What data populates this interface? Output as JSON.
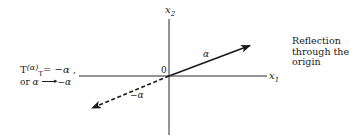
{
  "diagram": {
    "type": "vector-reflection",
    "axes": {
      "horizontal_label": "x",
      "horizontal_subscript": "1",
      "vertical_label": "x",
      "vertical_subscript": "2",
      "origin_label": "0"
    },
    "vectors": [
      {
        "name": "alpha",
        "label": "α",
        "style": "solid",
        "direction": "up-right"
      },
      {
        "name": "neg-alpha",
        "label": "−α",
        "style": "dashed",
        "direction": "down-left"
      }
    ],
    "caption_lines": [
      "Reflection",
      "through the",
      "origin"
    ],
    "equation": {
      "line1_T": "T",
      "line1_arg": "(α)",
      "line1_rhs": "= −α ,",
      "line2_or": "or",
      "line2_lhs": "α",
      "line2_T": "T",
      "line2_rhs": "−α"
    },
    "colors": {
      "ink": "#1a1a1a",
      "background": "#ffffff"
    }
  }
}
